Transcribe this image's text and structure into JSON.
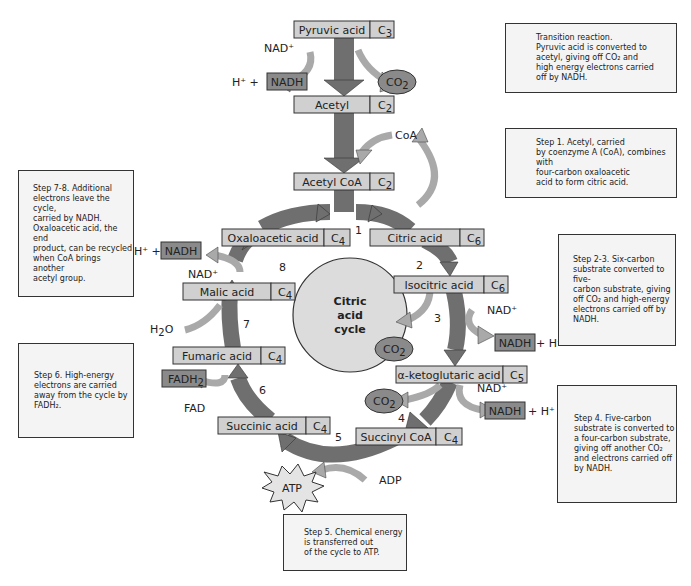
{
  "colors": {
    "box_fill": "#d0d0d0",
    "dark_box_fill": "#8a8a8a",
    "main_arrow": "#6f6f6f",
    "side_arrow": "#a9a9a9",
    "circle_fill": "#dcdcdc",
    "note_fill": "#f4f4f4"
  },
  "compounds": {
    "pyruvic": {
      "label": "Pyruvic acid",
      "carbons": "C",
      "sub": "3"
    },
    "acetyl": {
      "label": "Acetyl",
      "carbons": "C",
      "sub": "2"
    },
    "acetyl_coa": {
      "label": "Acetyl CoA",
      "carbons": "C",
      "sub": "2"
    },
    "citric": {
      "label": "Citric acid",
      "carbons": "C",
      "sub": "6"
    },
    "isocitric": {
      "label": "Isocitric acid",
      "carbons": "C",
      "sub": "6"
    },
    "ketoglutaric": {
      "label": "α-ketoglutaric acid",
      "carbons": "C",
      "sub": "5"
    },
    "succinyl_coa": {
      "label": "Succinyl CoA",
      "carbons": "C",
      "sub": "4"
    },
    "succinic": {
      "label": "Succinic acid",
      "carbons": "C",
      "sub": "4"
    },
    "fumaric": {
      "label": "Fumaric acid",
      "carbons": "C",
      "sub": "4"
    },
    "malic": {
      "label": "Malic acid",
      "carbons": "C",
      "sub": "4"
    },
    "oxaloacetic": {
      "label": "Oxaloacetic acid",
      "carbons": "C",
      "sub": "4"
    }
  },
  "molecules": {
    "nad": "NAD⁺",
    "nadh": "NADH",
    "h_plus": "H⁺",
    "h_plus_plus": "H⁺ +",
    "plus_h": "+ H⁺",
    "co2": "CO",
    "co2_sub": "2",
    "coa": "CoA",
    "h2o": "H",
    "h2o_sub": "2",
    "h2o_end": "O",
    "fadh2": "FADH",
    "fadh2_sub": "2",
    "fad": "FAD",
    "atp": "ATP",
    "adp": "ADP"
  },
  "center": {
    "line1": "Citric",
    "line2": "acid",
    "line3": "cycle"
  },
  "steps": [
    "1",
    "2",
    "3",
    "4",
    "5",
    "6",
    "7",
    "8"
  ],
  "notes": {
    "transition": "Transition reaction.\nPyruvic acid is converted to\nacetyl, giving off CO₂ and\nhigh energy electrons carried\noff by NADH.",
    "step1": "Step 1. Acetyl, carried\nby coenzyme A (CoA), combines with\nfour-carbon oxaloacetic\nacid to form citric acid.",
    "step2_3": "Step 2-3. Six-carbon\nsubstrate converted to five-\ncarbon substrate, giving\noff CO₂ and high-energy\nelectrons carried off by\nNADH.",
    "step4": "Step 4. Five-carbon\nsubstrate is converted to\na four-carbon substrate,\ngiving off another CO₂\nand electrons carried off\nby NADH.",
    "step5": "Step 5. Chemical energy\nis transferred out\nof the cycle to ATP.",
    "step6": "Step 6. High-energy\nelectrons are carried\naway from the cycle by\nFADH₂.",
    "step7_8": "Step 7-8. Additional\nelectrons leave the cycle,\ncarried by NADH.\nOxaloacetic acid, the end\nproduct, can be recycled\nwhen CoA brings another\nacetyl group."
  }
}
